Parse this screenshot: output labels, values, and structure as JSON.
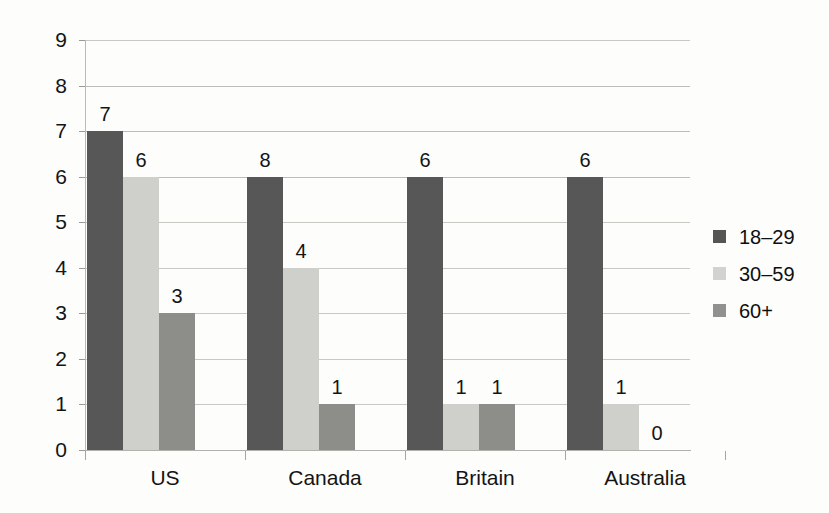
{
  "chart_data": {
    "type": "bar",
    "title": "",
    "subtitle": "",
    "xlabel": "",
    "ylabel": "",
    "ylim": [
      0,
      9
    ],
    "ytick_labels": [
      "0",
      "1",
      "2",
      "3",
      "4",
      "5",
      "6",
      "7",
      "8",
      "9"
    ],
    "grid": true,
    "legend_position": "right",
    "categories": [
      "US",
      "Canada",
      "Britain",
      "Australia"
    ],
    "series": [
      {
        "name": "18–29",
        "color": "#575757",
        "values": [
          7,
          6,
          6,
          6
        ]
      },
      {
        "name": "30–59",
        "color": "#cfcfcc",
        "values": [
          6,
          4,
          1,
          1
        ]
      },
      {
        "name": "60+",
        "color": "#8d8d8a",
        "values": [
          3,
          1,
          1,
          0
        ]
      }
    ],
    "value_labels": [
      [
        "7",
        "6",
        "3"
      ],
      [
        "8",
        "4",
        "1"
      ],
      [
        "6",
        "1",
        "1"
      ],
      [
        "6",
        "1",
        "0"
      ]
    ],
    "bar_values": [
      [
        7,
        6,
        3
      ],
      [
        8,
        4,
        1
      ],
      [
        6,
        1,
        1
      ],
      [
        6,
        1,
        0
      ]
    ]
  },
  "legend": {
    "items": [
      {
        "label": "18–29"
      },
      {
        "label": "30–59"
      },
      {
        "label": "60+"
      }
    ]
  },
  "axis": {
    "y_labels": [
      "9",
      "8",
      "7",
      "6",
      "5",
      "4",
      "3",
      "2",
      "1",
      "0"
    ],
    "x_labels": [
      "US",
      "Canada",
      "Britain",
      "Australia"
    ]
  },
  "colors": {
    "series_18_29": "#575757",
    "series_30_59": "#cfcfcc",
    "series_60_plus": "#8d8d8a",
    "grid": "#c9c9c4",
    "text": "#141414",
    "background": "#fdfdfc"
  }
}
